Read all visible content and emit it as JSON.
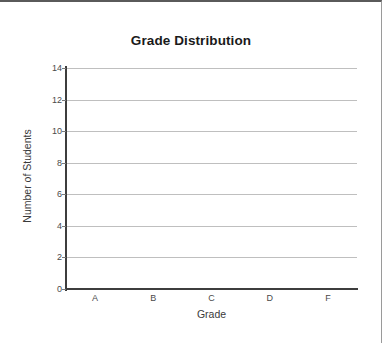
{
  "chart_data": {
    "type": "bar",
    "title": "Grade Distribution",
    "xlabel": "Grade",
    "ylabel": "Number of Students",
    "categories": [
      "A",
      "B",
      "C",
      "D",
      "F"
    ],
    "values": [
      0,
      0,
      0,
      0,
      0
    ],
    "yticks": [
      "14",
      "12",
      "10",
      "8",
      "6",
      "4",
      "2",
      "0"
    ],
    "ytick_values": [
      14,
      12,
      10,
      8,
      6,
      4,
      2,
      0
    ],
    "ylim": [
      0,
      14
    ],
    "grid": true,
    "legend": false,
    "legend_position": "none",
    "note": "empty plot area — no bars rendered",
    "colors": {
      "title": "#1a1a1a",
      "axis_line": "#3d3d3d",
      "gridline": "#bfbfbf",
      "tick_label": "#4a4a4a",
      "axis_title": "#3a3a3a",
      "frame_top": "#5a5a5a",
      "frame_right": "#9a9a9a",
      "background": "#ffffff"
    }
  }
}
